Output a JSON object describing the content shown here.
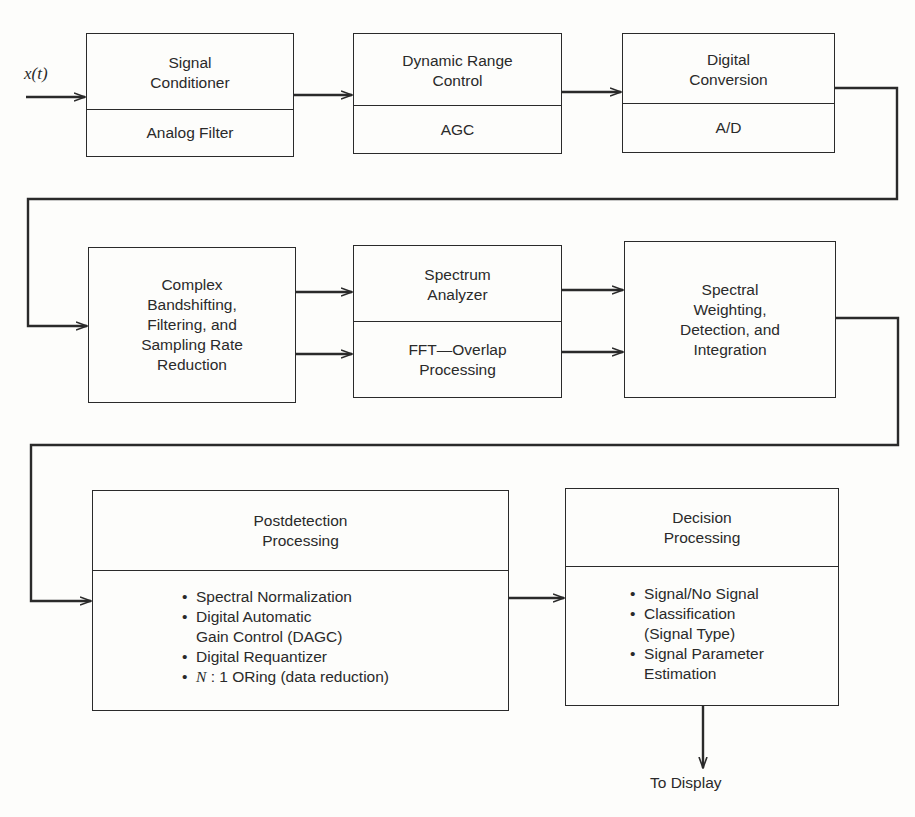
{
  "diagram": {
    "input_label": "x(t)",
    "output_label": "To Display",
    "colors": {
      "line": "#2a2a2a",
      "background": "#fdfdfb"
    },
    "blocks": [
      {
        "id": "signal-conditioner",
        "title": "Signal\nConditioner",
        "subtitle": "Analog Filter"
      },
      {
        "id": "dynamic-range-control",
        "title": "Dynamic Range\nControl",
        "subtitle": "AGC"
      },
      {
        "id": "digital-conversion",
        "title": "Digital\nConversion",
        "subtitle": "A/D"
      },
      {
        "id": "complex-bandshifting",
        "title": "Complex\nBandshifting,\nFiltering, and\nSampling Rate\nReduction"
      },
      {
        "id": "spectrum-analyzer",
        "title": "Spectrum\nAnalyzer",
        "subtitle": "FFT—Overlap\nProcessing"
      },
      {
        "id": "spectral-weighting",
        "title": "Spectral\nWeighting,\nDetection, and\nIntegration"
      },
      {
        "id": "postdetection-processing",
        "title": "Postdetection\nProcessing",
        "items": [
          "Spectral Normalization",
          "Digital Automatic\nGain Control (DAGC)",
          "Digital Requantizer",
          "N : 1 ORing (data reduction)"
        ]
      },
      {
        "id": "decision-processing",
        "title": "Decision\nProcessing",
        "items": [
          "Signal/No Signal",
          "Classification\n(Signal Type)",
          "Signal Parameter\nEstimation"
        ]
      }
    ],
    "connections": [
      [
        "input",
        "signal-conditioner"
      ],
      [
        "signal-conditioner",
        "dynamic-range-control"
      ],
      [
        "dynamic-range-control",
        "digital-conversion"
      ],
      [
        "digital-conversion",
        "complex-bandshifting"
      ],
      [
        "complex-bandshifting",
        "spectrum-analyzer"
      ],
      [
        "complex-bandshifting",
        "spectrum-analyzer"
      ],
      [
        "spectrum-analyzer",
        "spectral-weighting"
      ],
      [
        "spectrum-analyzer",
        "spectral-weighting"
      ],
      [
        "spectral-weighting",
        "postdetection-processing"
      ],
      [
        "postdetection-processing",
        "decision-processing"
      ],
      [
        "decision-processing",
        "output"
      ]
    ]
  }
}
